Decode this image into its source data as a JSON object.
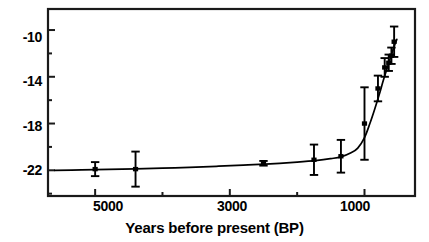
{
  "chart_data": {
    "type": "line",
    "title": "",
    "xlabel": "Years before present (BP)",
    "ylabel": "",
    "xlim": [
      5700,
      250
    ],
    "ylim": [
      -24.2,
      -8.2
    ],
    "x_reversed": true,
    "grid": false,
    "legend": "none",
    "x_ticks_major": [
      5000,
      3000,
      1000
    ],
    "x_tick_labels": [
      "5000",
      "3000",
      "1000"
    ],
    "x_ticks_minor": [
      4000,
      2000
    ],
    "y_ticks_major": [
      -10,
      -14,
      -18,
      -22
    ],
    "y_tick_labels": [
      "-10",
      "-14",
      "-18",
      "-22"
    ],
    "y_ticks_minor": [
      -12,
      -16,
      -20,
      -24
    ],
    "marker": "filled-square-with-error-bars",
    "series": [
      {
        "name": "measurements",
        "x": [
          5000,
          4400,
          2500,
          1750,
          1350,
          1000,
          800,
          700,
          640,
          600,
          560
        ],
        "y": [
          -21.9,
          -21.9,
          -21.4,
          -21.1,
          -20.8,
          -18.0,
          -15.0,
          -13.2,
          -12.8,
          -12.2,
          -11.0
        ],
        "yerr": [
          0.6,
          1.5,
          0.2,
          1.3,
          1.4,
          3.1,
          1.1,
          0.8,
          0.7,
          0.7,
          1.3
        ]
      }
    ],
    "fit_curve": {
      "name": "exponential-fit",
      "x": [
        5600,
        5200,
        4800,
        4400,
        4000,
        3600,
        3200,
        2800,
        2400,
        2000,
        1700,
        1500,
        1350,
        1200,
        1100,
        1000,
        920,
        850,
        780,
        720,
        660,
        610,
        560,
        520
      ],
      "y": [
        -22.0,
        -21.97,
        -21.93,
        -21.88,
        -21.82,
        -21.75,
        -21.66,
        -21.56,
        -21.45,
        -21.3,
        -21.15,
        -21.0,
        -20.85,
        -20.5,
        -20.1,
        -19.2,
        -18.0,
        -16.8,
        -15.5,
        -14.3,
        -13.2,
        -12.3,
        -11.4,
        -10.8
      ]
    }
  },
  "axes": {
    "x_title": "Years before present (BP)",
    "x_labels": [
      "5000",
      "3000",
      "1000"
    ],
    "y_labels": [
      "-10",
      "-14",
      "-18",
      "-22"
    ]
  },
  "colors": {
    "line": "#000000",
    "marker": "#000000",
    "axis": "#1a1a1a",
    "background": "#ffffff"
  }
}
